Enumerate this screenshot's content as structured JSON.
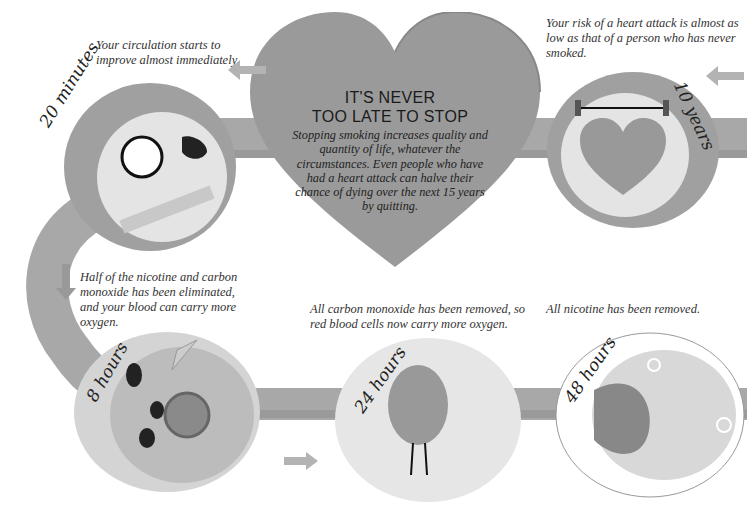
{
  "heart": {
    "title_line1": "IT'S NEVER",
    "title_line2": "TOO LATE TO STOP",
    "body": "Stopping smoking increases quality and quantity of life, whatever the circumstances. Even people who have had a heart attack can halve their chance of dying over the next 15 years by quitting."
  },
  "stages": [
    {
      "label": "20 minutes",
      "caption": "Your circulation starts to improve almost immediately.",
      "icon": "blood-pressure-gauge-icon"
    },
    {
      "label": "8 hours",
      "caption": "Half of the nicotine and carbon monoxide has been eliminated, and your blood can carry more oxygen.",
      "icon": "blood-cell-with-net-icon"
    },
    {
      "label": "24 hours",
      "caption": "All carbon monoxide has been removed, so red blood cells now carry more oxygen.",
      "icon": "blood-cell-character-icon"
    },
    {
      "label": "48 hours",
      "caption": "All nicotine has been removed.",
      "icon": "oxygen-molecules-icon"
    },
    {
      "label": "10 years",
      "caption": "Your risk of a heart attack is almost as low as that of a person who has never smoked.",
      "icon": "weightlifting-heart-icon"
    }
  ],
  "colors": {
    "band": "#a9a9a9",
    "circle_ring": "#9c9c9c",
    "circle_fill": "#e6e6e6",
    "heart": "#999999",
    "arrow": "#b5b5b5"
  }
}
